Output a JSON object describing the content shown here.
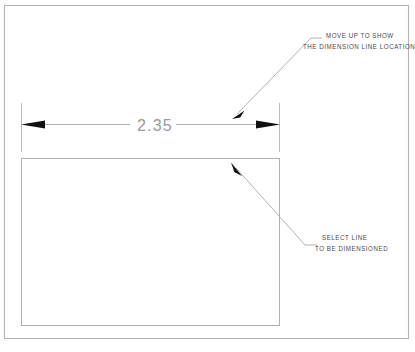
{
  "drawing": {
    "title": "CAD dimension tutorial view",
    "frame": {
      "name": "drawing-border",
      "stroke": "#b4b4b4"
    },
    "colors": {
      "frame": "#b4b4b4",
      "geometry": "#b0b0b0",
      "extension_line": "#b8b8b8",
      "dimension_line": "#a0a0a0",
      "arrowhead": "#111111",
      "leader": "#9a9a9a",
      "text": "#4a4a4a",
      "dimension_text": "#9a9a9a",
      "background": "#ffffff"
    },
    "dimension": {
      "name": "horizontal-dimension",
      "value": "2.35",
      "left_arrow": "arrow-left",
      "right_arrow": "arrow-right",
      "extension_line_left": "extension-line-left",
      "extension_line_right": "extension-line-right"
    },
    "shape": {
      "name": "rectangle-object",
      "label": "rectangle"
    },
    "annotations": [
      {
        "id": "move-up-note",
        "lines": [
          "MOVE UP TO SHOW",
          "THE DIMENSION LINE LOCATION"
        ],
        "leader": "leader-line-top",
        "arrow": "leader-arrow-top"
      },
      {
        "id": "select-line-note",
        "lines": [
          "SELECT LINE",
          "TO BE DIMENSIONED"
        ],
        "leader": "leader-line-bottom",
        "arrow": "leader-arrow-bottom"
      }
    ]
  }
}
